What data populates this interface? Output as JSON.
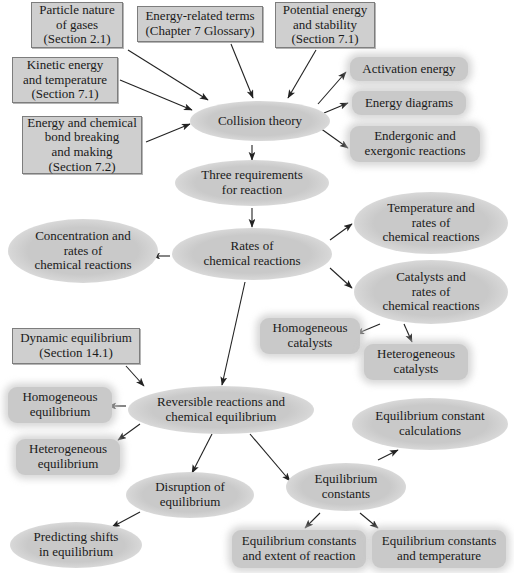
{
  "diagram": {
    "colors": {
      "background": "#ffffff",
      "box_fill": "#cfcfcf",
      "box_border": "#7d7d7d",
      "ellipse_fill": "#c9c9c9",
      "text": "#1a1a1a",
      "arrow": "#222222"
    },
    "nodes": [
      {
        "id": "particle_nature",
        "shape": "box",
        "label": "Particle nature\nof gases\n(Section 2.1)",
        "x": 31,
        "y": 2,
        "w": 90,
        "h": 44
      },
      {
        "id": "energy_terms",
        "shape": "box",
        "label": "Energy-related terms\n(Chapter 7 Glossary)",
        "x": 137,
        "y": 6,
        "w": 124,
        "h": 34
      },
      {
        "id": "potential_energy",
        "shape": "box",
        "label": "Potential energy\nand stability\n(Section 7.1)",
        "x": 275,
        "y": 2,
        "w": 98,
        "h": 44
      },
      {
        "id": "kinetic_energy",
        "shape": "box",
        "label": "Kinetic energy\nand temperature\n(Section 7.1)",
        "x": 12,
        "y": 57,
        "w": 104,
        "h": 44
      },
      {
        "id": "energy_bond",
        "shape": "box",
        "label": "Energy and chemical\nbond breaking\nand making\n(Section 7.2)",
        "x": 22,
        "y": 116,
        "w": 118,
        "h": 56
      },
      {
        "id": "collision_theory",
        "shape": "ellipse",
        "label": "Collision theory",
        "x": 190,
        "y": 101,
        "w": 140,
        "h": 40
      },
      {
        "id": "activation_energy",
        "shape": "round",
        "label": "Activation energy",
        "x": 350,
        "y": 57,
        "w": 118,
        "h": 24
      },
      {
        "id": "energy_diagrams",
        "shape": "round",
        "label": "Energy diagrams",
        "x": 352,
        "y": 91,
        "w": 114,
        "h": 24
      },
      {
        "id": "endergonic_exergonic",
        "shape": "round",
        "label": "Endergonic and\nexergonic reactions",
        "x": 350,
        "y": 126,
        "w": 130,
        "h": 36
      },
      {
        "id": "three_requirements",
        "shape": "ellipse",
        "label": "Three requirements\nfor reaction",
        "x": 175,
        "y": 160,
        "w": 154,
        "h": 46
      },
      {
        "id": "rates_of_reactions",
        "shape": "ellipse",
        "label": "Rates of\nchemical reactions",
        "x": 172,
        "y": 228,
        "w": 160,
        "h": 52
      },
      {
        "id": "concentration_rates",
        "shape": "ellipse",
        "label": "Concentration and\nrates of\nchemical reactions",
        "x": 8,
        "y": 219,
        "w": 150,
        "h": 64
      },
      {
        "id": "temperature_rates",
        "shape": "ellipse",
        "label": "Temperature and\nrates of\nchemical reactions",
        "x": 354,
        "y": 192,
        "w": 154,
        "h": 62
      },
      {
        "id": "catalysts_rates",
        "shape": "ellipse",
        "label": "Catalysts and\nrates of\nchemical reactions",
        "x": 354,
        "y": 260,
        "w": 154,
        "h": 64
      },
      {
        "id": "homogeneous_catalysts",
        "shape": "round",
        "label": "Homogeneous\ncatalysts",
        "x": 260,
        "y": 318,
        "w": 100,
        "h": 36
      },
      {
        "id": "heterogeneous_catalysts",
        "shape": "round",
        "label": "Heterogeneous\ncatalysts",
        "x": 364,
        "y": 344,
        "w": 104,
        "h": 36
      },
      {
        "id": "dynamic_equilibrium",
        "shape": "box",
        "label": "Dynamic equilibrium\n(Section 14.1)",
        "x": 12,
        "y": 328,
        "w": 126,
        "h": 34
      },
      {
        "id": "homogeneous_equilibrium",
        "shape": "round",
        "label": "Homogeneous\nequilibrium",
        "x": 8,
        "y": 387,
        "w": 104,
        "h": 36
      },
      {
        "id": "reversible_reactions",
        "shape": "ellipse",
        "label": "Reversible reactions and\nchemical equilibrium",
        "x": 128,
        "y": 386,
        "w": 186,
        "h": 48
      },
      {
        "id": "heterogeneous_equilibrium",
        "shape": "round",
        "label": "Heterogeneous\nequilibrium",
        "x": 16,
        "y": 439,
        "w": 104,
        "h": 36
      },
      {
        "id": "equilibrium_constant_calculations",
        "shape": "ellipse",
        "label": "Equilibrium constant\ncalculations",
        "x": 352,
        "y": 398,
        "w": 156,
        "h": 52
      },
      {
        "id": "disruption_equilibrium",
        "shape": "ellipse",
        "label": "Disruption of\nequilibrium",
        "x": 126,
        "y": 472,
        "w": 128,
        "h": 46
      },
      {
        "id": "equilibrium_constants",
        "shape": "ellipse",
        "label": "Equilibrium\nconstants",
        "x": 286,
        "y": 463,
        "w": 120,
        "h": 48
      },
      {
        "id": "predicting_shifts",
        "shape": "ellipse",
        "label": "Predicting shifts\nin equilibrium",
        "x": 10,
        "y": 522,
        "w": 132,
        "h": 46
      },
      {
        "id": "constants_extent",
        "shape": "round",
        "label": "Equilibrium constants\nand extent of reaction",
        "x": 232,
        "y": 530,
        "w": 134,
        "h": 38
      },
      {
        "id": "constants_temperature",
        "shape": "round",
        "label": "Equilibrium constants\nand temperature",
        "x": 372,
        "y": 530,
        "w": 134,
        "h": 38
      }
    ],
    "edges": [
      {
        "from": "particle_nature",
        "to": "collision_theory",
        "x1": 128,
        "y1": 50,
        "x2": 208,
        "y2": 100
      },
      {
        "from": "energy_terms",
        "to": "collision_theory",
        "x1": 231,
        "y1": 44,
        "x2": 253,
        "y2": 98
      },
      {
        "from": "potential_energy",
        "to": "collision_theory",
        "x1": 316,
        "y1": 50,
        "x2": 288,
        "y2": 98
      },
      {
        "from": "kinetic_energy",
        "to": "collision_theory",
        "x1": 120,
        "y1": 80,
        "x2": 192,
        "y2": 110
      },
      {
        "from": "energy_bond",
        "to": "collision_theory",
        "x1": 146,
        "y1": 142,
        "x2": 190,
        "y2": 124
      },
      {
        "from": "collision_theory",
        "to": "activation_energy",
        "x1": 318,
        "y1": 104,
        "x2": 346,
        "y2": 72
      },
      {
        "from": "collision_theory",
        "to": "energy_diagrams",
        "x1": 324,
        "y1": 113,
        "x2": 348,
        "y2": 103
      },
      {
        "from": "collision_theory",
        "to": "endergonic_exergonic",
        "x1": 320,
        "y1": 128,
        "x2": 348,
        "y2": 148
      },
      {
        "from": "collision_theory",
        "to": "three_requirements",
        "x1": 252,
        "y1": 145,
        "x2": 252,
        "y2": 160
      },
      {
        "from": "three_requirements",
        "to": "rates_of_reactions",
        "x1": 252,
        "y1": 208,
        "x2": 252,
        "y2": 227
      },
      {
        "from": "rates_of_reactions",
        "to": "concentration_rates",
        "x1": 170,
        "y1": 256,
        "x2": 152,
        "y2": 256
      },
      {
        "from": "rates_of_reactions",
        "to": "temperature_rates",
        "x1": 330,
        "y1": 240,
        "x2": 352,
        "y2": 224
      },
      {
        "from": "rates_of_reactions",
        "to": "catalysts_rates",
        "x1": 330,
        "y1": 268,
        "x2": 352,
        "y2": 288
      },
      {
        "from": "catalysts_rates",
        "to": "homogeneous_catalysts",
        "x1": 380,
        "y1": 324,
        "x2": 356,
        "y2": 334
      },
      {
        "from": "catalysts_rates",
        "to": "heterogeneous_catalysts",
        "x1": 404,
        "y1": 324,
        "x2": 412,
        "y2": 342
      },
      {
        "from": "rates_of_reactions",
        "to": "reversible_reactions",
        "x1": 245,
        "y1": 282,
        "x2": 222,
        "y2": 385
      },
      {
        "from": "dynamic_equilibrium",
        "to": "reversible_reactions",
        "x1": 126,
        "y1": 366,
        "x2": 144,
        "y2": 386
      },
      {
        "from": "reversible_reactions",
        "to": "homogeneous_equilibrium",
        "x1": 126,
        "y1": 406,
        "x2": 108,
        "y2": 406
      },
      {
        "from": "reversible_reactions",
        "to": "heterogeneous_equilibrium",
        "x1": 140,
        "y1": 424,
        "x2": 118,
        "y2": 440
      },
      {
        "from": "reversible_reactions",
        "to": "disruption_equilibrium",
        "x1": 212,
        "y1": 434,
        "x2": 192,
        "y2": 473
      },
      {
        "from": "reversible_reactions",
        "to": "equilibrium_constants",
        "x1": 250,
        "y1": 434,
        "x2": 290,
        "y2": 481
      },
      {
        "from": "disruption_equilibrium",
        "to": "predicting_shifts",
        "x1": 140,
        "y1": 512,
        "x2": 112,
        "y2": 527
      },
      {
        "from": "equilibrium_constants",
        "to": "equilibrium_constant_calculations",
        "x1": 378,
        "y1": 460,
        "x2": 398,
        "y2": 450
      },
      {
        "from": "equilibrium_constants",
        "to": "constants_extent",
        "x1": 320,
        "y1": 513,
        "x2": 305,
        "y2": 528
      },
      {
        "from": "equilibrium_constants",
        "to": "constants_temperature",
        "x1": 360,
        "y1": 513,
        "x2": 378,
        "y2": 528
      }
    ]
  }
}
